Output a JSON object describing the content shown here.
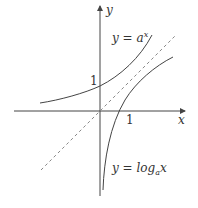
{
  "diagram": {
    "axes": {
      "x_label": "x",
      "y_label": "y"
    },
    "tick_labels": {
      "x_one": "1",
      "y_one": "1"
    },
    "curves": [
      {
        "name": "exponential",
        "label": "y = a",
        "superscript": "x"
      },
      {
        "name": "logarithm",
        "label_prefix": "y = log",
        "subscript": "a",
        "label_suffix": "x"
      },
      {
        "name": "identity-line",
        "style": "dashed"
      }
    ],
    "colors": {
      "curve": "#444444",
      "dashed": "#888888",
      "axis": "#444444"
    }
  }
}
